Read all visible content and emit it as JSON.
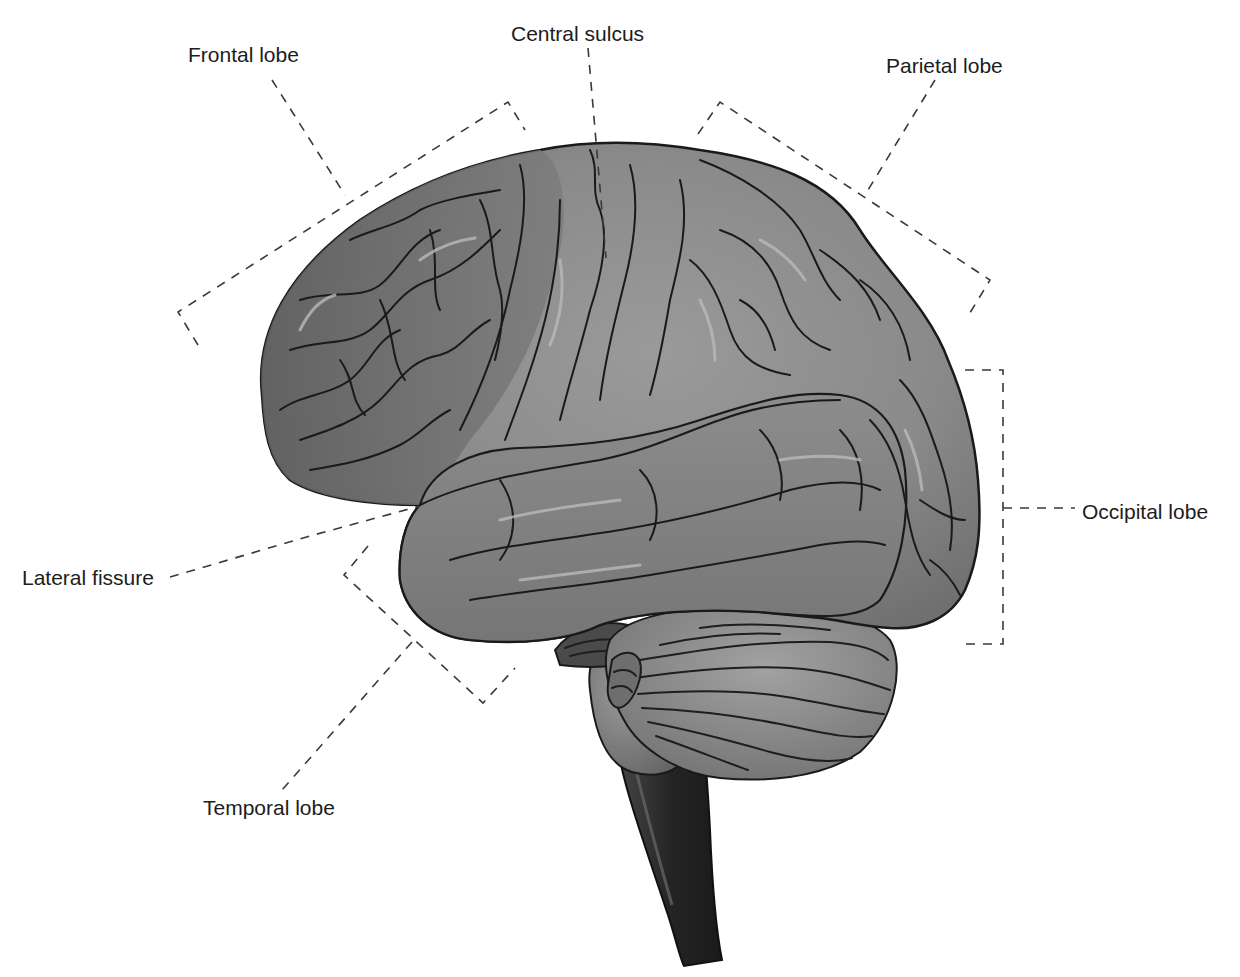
{
  "diagram": {
    "labels": {
      "frontal_lobe": "Frontal lobe",
      "central_sulcus": "Central sulcus",
      "parietal_lobe": "Parietal lobe",
      "occipital_lobe": "Occipital lobe",
      "lateral_fissure": "Lateral fissure",
      "temporal_lobe": "Temporal lobe"
    },
    "colors": {
      "background": "#ffffff",
      "cortex": "#8a8a8a",
      "cortex_dark": "#6b6b6b",
      "cerebellum": "#8e8e8e",
      "brainstem": "#2e2e2e",
      "outline": "#1a1a1a",
      "leader_line": "#3a3a3a",
      "label_text": "#1c1c1c"
    }
  }
}
